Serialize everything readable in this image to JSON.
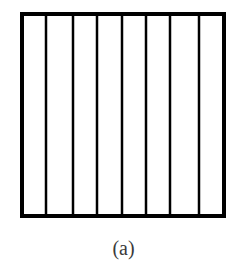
{
  "figure": {
    "caption": "(a)",
    "box": {
      "x": 20,
      "y": 12,
      "width": 206,
      "height": 206,
      "border_width": 4,
      "stroke_color": "#000000",
      "fill_color": "#ffffff"
    },
    "vertical_lines": {
      "count": 7,
      "stroke_width": 2.5,
      "stroke_color": "#000000",
      "x_positions": [
        46,
        73,
        97,
        122,
        146,
        170,
        199
      ]
    },
    "strip_count": 8
  }
}
